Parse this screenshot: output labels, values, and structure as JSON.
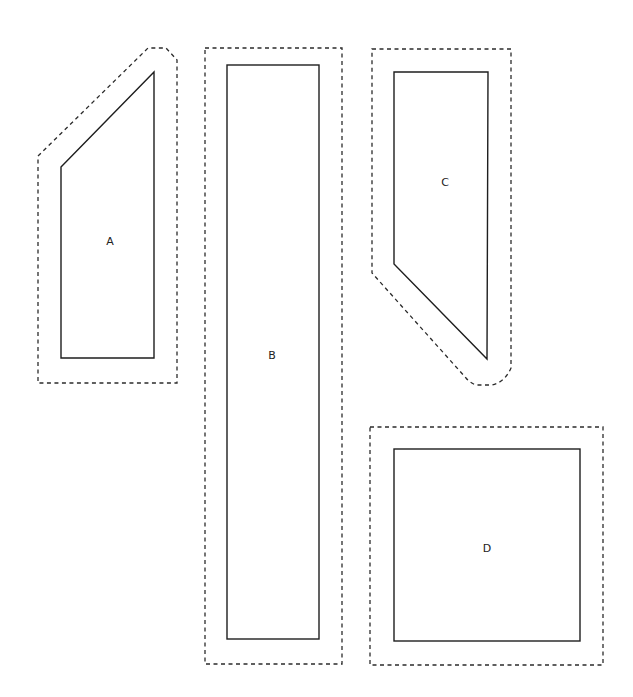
{
  "pieces": [
    {
      "id": "A",
      "label": "A"
    },
    {
      "id": "B",
      "label": "B"
    },
    {
      "id": "C",
      "label": "C"
    },
    {
      "id": "D",
      "label": "D"
    }
  ],
  "styles": {
    "stroke_color": "#222222",
    "background": "#ffffff"
  }
}
